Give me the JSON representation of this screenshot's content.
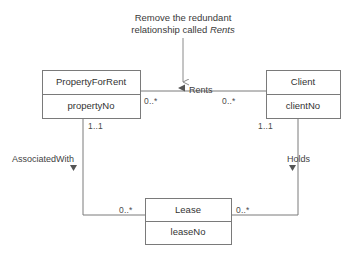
{
  "diagram": {
    "type": "uml-class-diagram",
    "background_color": "#ffffff",
    "line_color": "#7a7a7a",
    "text_color": "#3a3a3a",
    "annotation": {
      "line1": "Remove the redundant",
      "line2_prefix": "relationship called ",
      "line2_emphasis": "Rents"
    },
    "classes": [
      {
        "name": "PropertyForRent",
        "attribute": "propertyNo"
      },
      {
        "name": "Client",
        "attribute": "clientNo"
      },
      {
        "name": "Lease",
        "attribute": "leaseNo"
      }
    ],
    "associations": [
      {
        "name": "Rents",
        "direction_marker": "left-triangle",
        "from": "PropertyForRent",
        "to": "Client",
        "from_multiplicity": "0..*",
        "to_multiplicity": "0..*"
      },
      {
        "name": "AssociatedWith",
        "direction_marker": "down-triangle",
        "from": "PropertyForRent",
        "to": "Lease",
        "from_multiplicity": "1..1",
        "to_multiplicity": "0..*"
      },
      {
        "name": "Holds",
        "direction_marker": "down-triangle",
        "from": "Client",
        "to": "Lease",
        "from_multiplicity": "1..1",
        "to_multiplicity": "0..*"
      }
    ],
    "multiplicity_labels": {
      "rents_left": "0..*",
      "rents_right": "0..*",
      "property_down": "1..1",
      "client_down": "1..1",
      "lease_left": "0..*",
      "lease_right": "0..*"
    }
  }
}
